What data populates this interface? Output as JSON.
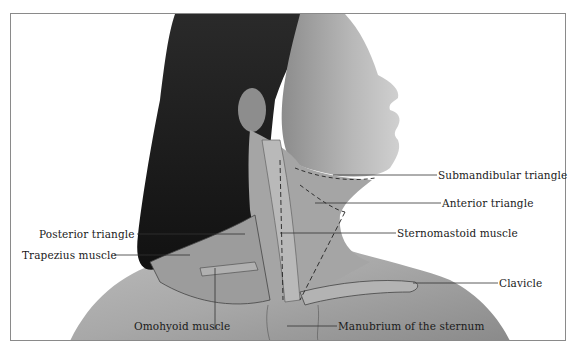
{
  "figure": {
    "colors": {
      "frame": "#8a8a8a",
      "ink": "#1a1a1a",
      "hair": "#1c1c1c",
      "skin_light": "#c9c9c9",
      "skin_mid": "#9a9a9a",
      "skin_dark": "#6a6a6a"
    },
    "labels": [
      {
        "id": "submandibular",
        "text": "Submandibular triangle",
        "side": "right"
      },
      {
        "id": "anterior",
        "text": "Anterior triangle",
        "side": "right"
      },
      {
        "id": "sternomastoid",
        "text": "Sternomastoid muscle",
        "side": "right"
      },
      {
        "id": "clavicle",
        "text": "Clavicle",
        "side": "right"
      },
      {
        "id": "manubrium",
        "text": "Manubrium of the sternum",
        "side": "bottom"
      },
      {
        "id": "omohyoid",
        "text": "Omohyoid muscle",
        "side": "bottom"
      },
      {
        "id": "posterior",
        "text": "Posterior triangle",
        "side": "left"
      },
      {
        "id": "trapezius",
        "text": "Trapezius muscle",
        "side": "left"
      }
    ]
  }
}
